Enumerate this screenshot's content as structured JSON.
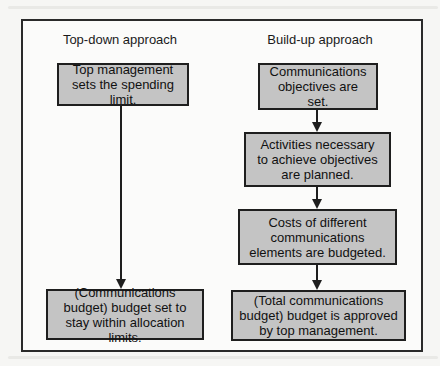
{
  "diagram": {
    "columns": [
      {
        "title": "Top-down approach",
        "boxes": [
          {
            "text": "Top management sets the spending limit."
          },
          {
            "text": "(Communications budget) budget set to stay within allocation limits."
          }
        ]
      },
      {
        "title": "Build-up approach",
        "boxes": [
          {
            "text": "Communications objectives are set."
          },
          {
            "text": "Activities necessary to achieve objectives are planned."
          },
          {
            "text": "Costs of different communications elements are budgeted."
          },
          {
            "text": "(Total communications budget) budget is approved by top management."
          }
        ]
      }
    ],
    "colors": {
      "box_fill": "#c4c4c4",
      "border": "#1e1e1e",
      "background": "#f6f6f4"
    }
  }
}
